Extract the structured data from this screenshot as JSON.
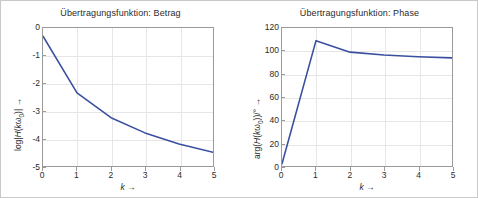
{
  "figure": {
    "background": "#ffffff",
    "border_color": "#c8c8c8",
    "line_color": "#3a4fa0",
    "grid_color": "#e6e6e6",
    "axis_color": "#9a9a9a"
  },
  "charts": [
    {
      "id": "betrag",
      "title": "Übertragungsfunktion: Betrag",
      "xlabel_text": "k →",
      "ylabel_text": "log|H(kω₀)| →",
      "xticks": [
        "0",
        "1",
        "2",
        "3",
        "4",
        "5"
      ],
      "yticks": [
        "0",
        "-1",
        "-2",
        "-3",
        "-4",
        "-5"
      ]
    },
    {
      "id": "phase",
      "title": "Übertragungsfunktion: Phase",
      "xlabel_text": "k →",
      "ylabel_text": "arg(H(kω₀))/° →",
      "xticks": [
        "0",
        "1",
        "2",
        "3",
        "4",
        "5"
      ],
      "yticks": [
        "0",
        "20",
        "40",
        "60",
        "80",
        "100",
        "120"
      ]
    }
  ],
  "chart_data": [
    {
      "type": "line",
      "title": "Übertragungsfunktion: Betrag",
      "xlabel": "k →",
      "ylabel": "log|H(kω₀)| →",
      "x": [
        0,
        1,
        2,
        3,
        4,
        5
      ],
      "values": [
        -0.3,
        -2.35,
        -3.25,
        -3.8,
        -4.2,
        -4.5
      ],
      "xlim": [
        0,
        5
      ],
      "ylim": [
        -5,
        0
      ],
      "xticks": [
        0,
        1,
        2,
        3,
        4,
        5
      ],
      "yticks": [
        0,
        -1,
        -2,
        -3,
        -4,
        -5
      ],
      "grid": true,
      "legend": null,
      "color": "#3a4fa0"
    },
    {
      "type": "line",
      "title": "Übertragungsfunktion: Phase",
      "xlabel": "k →",
      "ylabel": "arg(H(kω₀))/° →",
      "x": [
        0,
        1,
        2,
        3,
        4,
        5
      ],
      "values": [
        2,
        109,
        99,
        96.5,
        95,
        94
      ],
      "xlim": [
        0,
        5
      ],
      "ylim": [
        0,
        120
      ],
      "xticks": [
        0,
        1,
        2,
        3,
        4,
        5
      ],
      "yticks": [
        0,
        20,
        40,
        60,
        80,
        100,
        120
      ],
      "grid": true,
      "legend": null,
      "color": "#3a4fa0"
    }
  ]
}
